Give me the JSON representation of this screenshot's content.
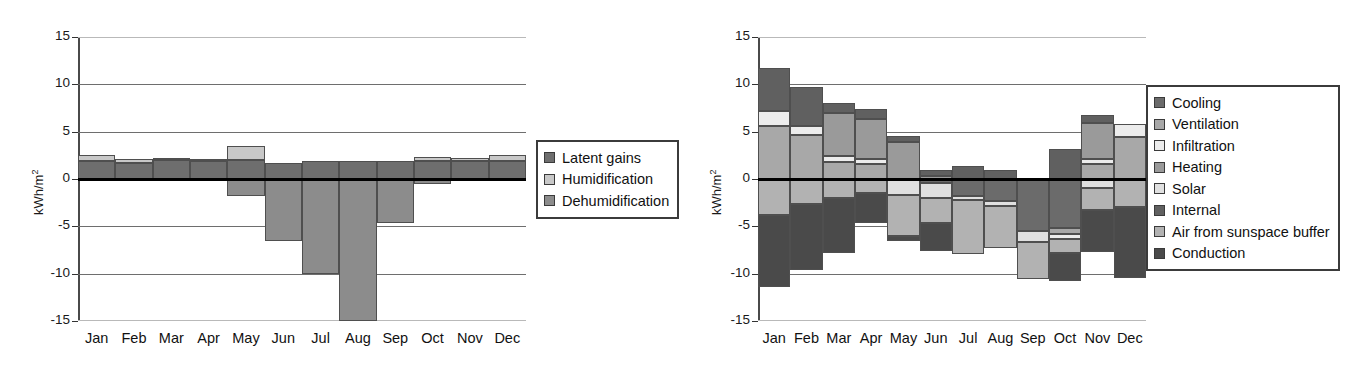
{
  "chart_data": [
    {
      "id": "latent-loads",
      "type": "bar",
      "stacked": true,
      "title": "",
      "xlabel": "",
      "ylabel": "kWh/m2",
      "ylabel_display": "kWh/m",
      "ylabel_exponent": "2",
      "ylim": [
        -15,
        15
      ],
      "yticks": [
        15,
        10,
        5,
        0,
        -5,
        -10,
        -15
      ],
      "grid": true,
      "legend_position": "right",
      "categories": [
        "Jan",
        "Feb",
        "Mar",
        "Apr",
        "May",
        "Jun",
        "Jul",
        "Aug",
        "Sep",
        "Oct",
        "Nov",
        "Dec"
      ],
      "series": [
        {
          "name": "Latent gains",
          "color": "#6e6e6e",
          "values": [
            1.9,
            1.7,
            2.0,
            1.9,
            2.0,
            1.7,
            1.9,
            1.9,
            1.9,
            1.9,
            1.9,
            1.9
          ]
        },
        {
          "name": "Humidification",
          "color": "#c8c8c8",
          "values": [
            0.6,
            0.4,
            0.2,
            0.2,
            1.5,
            0.0,
            0.0,
            0.0,
            0.0,
            0.4,
            0.3,
            0.6
          ]
        },
        {
          "name": "Dehumidification",
          "color": "#8c8c8c",
          "values": [
            0.0,
            0.0,
            0.0,
            0.0,
            -1.8,
            -6.5,
            -10.0,
            -15.0,
            -4.7,
            -0.5,
            -0.2,
            -0.1
          ]
        }
      ]
    },
    {
      "id": "sensible-balance",
      "type": "bar",
      "stacked": true,
      "title": "",
      "xlabel": "",
      "ylabel": "kWh/m2",
      "ylabel_display": "kWh/m",
      "ylabel_exponent": "2",
      "ylim": [
        -15,
        15
      ],
      "yticks": [
        15,
        10,
        5,
        0,
        -5,
        -10,
        -15
      ],
      "grid": true,
      "legend_position": "right",
      "categories": [
        "Jan",
        "Feb",
        "Mar",
        "Apr",
        "May",
        "Jun",
        "Jul",
        "Aug",
        "Sep",
        "Oct",
        "Nov",
        "Dec"
      ],
      "series": [
        {
          "name": "Cooling",
          "color": "#6b6b6b",
          "values": [
            0.0,
            0.0,
            0.0,
            0.0,
            0.0,
            -0.4,
            -1.8,
            -2.3,
            -5.5,
            -5.2,
            0.0,
            0.0
          ]
        },
        {
          "name": "Ventilation",
          "color": "#a8a8a8",
          "values": [
            5.6,
            4.6,
            1.8,
            1.6,
            0.0,
            0.0,
            0.0,
            0.0,
            0.0,
            -0.6,
            1.6,
            4.4
          ]
        },
        {
          "name": "Infiltration",
          "color": "#ececec",
          "values": [
            1.6,
            1.0,
            0.6,
            0.5,
            0.0,
            0.0,
            0.0,
            0.0,
            0.0,
            -0.5,
            0.5,
            1.4
          ]
        },
        {
          "name": "Heating",
          "color": "#9a9a9a",
          "values": [
            0.0,
            0.0,
            4.6,
            4.2,
            3.9,
            0.3,
            0.0,
            0.0,
            0.0,
            0.0,
            3.8,
            0.0
          ]
        },
        {
          "name": "Solar",
          "color": "#e0e0e0",
          "values": [
            0.0,
            0.0,
            0.0,
            0.0,
            -1.7,
            -1.6,
            -0.4,
            -0.6,
            -1.2,
            0.0,
            -1.0,
            0.0
          ]
        },
        {
          "name": "Internal",
          "color": "#606060",
          "values": [
            4.5,
            4.1,
            1.0,
            1.1,
            0.6,
            0.7,
            1.4,
            1.0,
            0.0,
            3.2,
            0.9,
            0.0
          ]
        },
        {
          "name": "Air from sunspace buffer",
          "color": "#b2b2b2",
          "values": [
            -3.8,
            -2.6,
            -2.0,
            -1.5,
            -4.3,
            -2.6,
            -5.7,
            -4.4,
            -3.9,
            -1.5,
            -2.3,
            -3.0
          ]
        },
        {
          "name": "Conduction",
          "color": "#4a4a4a",
          "values": [
            -7.6,
            -7.0,
            -5.8,
            -3.2,
            -0.5,
            -3.0,
            0.0,
            0.0,
            0.0,
            -3.0,
            -4.4,
            -7.5
          ]
        }
      ]
    }
  ],
  "left_chart": {
    "ylabel": "kWh/m",
    "ylabel_exponent": "2",
    "yticks": [
      "15",
      "10",
      "5",
      "0",
      "-5",
      "-10",
      "-15"
    ],
    "months": [
      "Jan",
      "Feb",
      "Mar",
      "Apr",
      "May",
      "Jun",
      "Jul",
      "Aug",
      "Sep",
      "Oct",
      "Nov",
      "Dec"
    ],
    "legend": [
      {
        "label": "Latent gains",
        "color": "#6e6e6e"
      },
      {
        "label": "Humidification",
        "color": "#c8c8c8"
      },
      {
        "label": "Dehumidification",
        "color": "#8c8c8c"
      }
    ]
  },
  "right_chart": {
    "ylabel": "kWh/m",
    "ylabel_exponent": "2",
    "yticks": [
      "15",
      "10",
      "5",
      "0",
      "-5",
      "-10",
      "-15"
    ],
    "months": [
      "Jan",
      "Feb",
      "Mar",
      "Apr",
      "May",
      "Jun",
      "Jul",
      "Aug",
      "Sep",
      "Oct",
      "Nov",
      "Dec"
    ],
    "legend": [
      {
        "label": "Cooling",
        "color": "#6b6b6b"
      },
      {
        "label": "Ventilation",
        "color": "#a8a8a8"
      },
      {
        "label": "Infiltration",
        "color": "#ececec"
      },
      {
        "label": "Heating",
        "color": "#9a9a9a"
      },
      {
        "label": "Solar",
        "color": "#e0e0e0"
      },
      {
        "label": "Internal",
        "color": "#606060"
      },
      {
        "label": "Air from sunspace buffer",
        "color": "#b2b2b2"
      },
      {
        "label": "Conduction",
        "color": "#4a4a4a"
      }
    ]
  }
}
